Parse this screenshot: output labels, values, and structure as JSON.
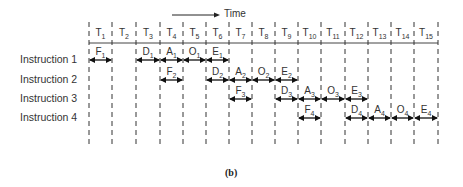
{
  "time_axis": {
    "label": "Time",
    "slots": [
      "T1",
      "T2",
      "T3",
      "T4",
      "T5",
      "T6",
      "T7",
      "T8",
      "T9",
      "T10",
      "T11",
      "T12",
      "T13",
      "T14",
      "T15"
    ],
    "boundaries_x": [
      89,
      112,
      136,
      160,
      183,
      206,
      229,
      252,
      275,
      298,
      321,
      345,
      368,
      391,
      414,
      438
    ]
  },
  "instructions": [
    {
      "label": "Instruction 1",
      "stages": [
        {
          "name": "F",
          "sub": "1",
          "start": 0,
          "end": 1
        },
        {
          "name": "D",
          "sub": "1",
          "start": 2,
          "end": 3
        },
        {
          "name": "A",
          "sub": "1",
          "start": 3,
          "end": 4
        },
        {
          "name": "O",
          "sub": "1",
          "start": 4,
          "end": 5
        },
        {
          "name": "E",
          "sub": "1",
          "start": 5,
          "end": 6
        }
      ]
    },
    {
      "label": "Instruction 2",
      "stages": [
        {
          "name": "F",
          "sub": "2",
          "start": 3,
          "end": 4
        },
        {
          "name": "D",
          "sub": "2",
          "start": 5,
          "end": 6
        },
        {
          "name": "A",
          "sub": "2",
          "start": 6,
          "end": 7
        },
        {
          "name": "O",
          "sub": "2",
          "start": 7,
          "end": 8
        },
        {
          "name": "E",
          "sub": "2",
          "start": 8,
          "end": 9
        }
      ]
    },
    {
      "label": "Instruction 3",
      "stages": [
        {
          "name": "F",
          "sub": "3",
          "start": 6,
          "end": 7
        },
        {
          "name": "D",
          "sub": "3",
          "start": 8,
          "end": 9
        },
        {
          "name": "A",
          "sub": "3",
          "start": 9,
          "end": 10
        },
        {
          "name": "O",
          "sub": "3",
          "start": 10,
          "end": 11
        },
        {
          "name": "E",
          "sub": "3",
          "start": 11,
          "end": 12
        }
      ]
    },
    {
      "label": "Instruction 4",
      "stages": [
        {
          "name": "F",
          "sub": "4",
          "start": 9,
          "end": 10
        },
        {
          "name": "D",
          "sub": "4",
          "start": 11,
          "end": 12
        },
        {
          "name": "A",
          "sub": "4",
          "start": 12,
          "end": 13
        },
        {
          "name": "O",
          "sub": "4",
          "start": 13,
          "end": 14
        },
        {
          "name": "E",
          "sub": "4",
          "start": 14,
          "end": 15
        }
      ]
    }
  ],
  "caption": "(b)"
}
